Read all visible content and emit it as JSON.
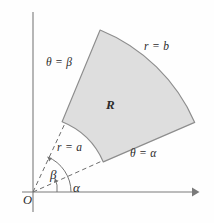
{
  "figure": {
    "type": "geometry-diagram",
    "background_color": "#fefefe",
    "region_fill_color": "#dedede",
    "region_stroke_color": "#8d8d8d",
    "axis_color": "#7a7a7a",
    "ray_color": "#6e6e6e",
    "text_color": "#2b2b2b"
  },
  "labels": {
    "outer_radius": "r = b",
    "inner_radius": "r = a",
    "upper_ray": "θ = β",
    "lower_ray": "θ = α",
    "region": "R",
    "angle_beta": "β",
    "angle_alpha": "α",
    "origin": "O"
  },
  "axes": {
    "x_axis_name": "horizontal-axis",
    "y_axis_name": "vertical-axis",
    "origin_x": 33,
    "origin_y": 192,
    "x_axis_start": 22,
    "x_axis_end": 197,
    "y_axis_top": 12,
    "y_axis_bottom": 212,
    "has_x_arrow": true,
    "has_y_arrow": false
  },
  "geometry": {
    "origin": [
      33,
      192
    ],
    "inner_radius": 76,
    "outer_radius": 175,
    "alpha_degrees": 23.4,
    "beta_degrees": 67.5,
    "region_corners": {
      "inner_alpha": [
        103,
        162
      ],
      "inner_beta": [
        62,
        122
      ],
      "outer_alpha": [
        194,
        122
      ],
      "outer_beta": [
        100,
        30
      ]
    },
    "angle_marker_radii": {
      "alpha_arc_radius": 38,
      "beta_arc_radius": 24
    },
    "dashed_ray_alpha_end": [
      120,
      153
    ],
    "dashed_ray_beta_end": [
      71,
      113
    ]
  }
}
